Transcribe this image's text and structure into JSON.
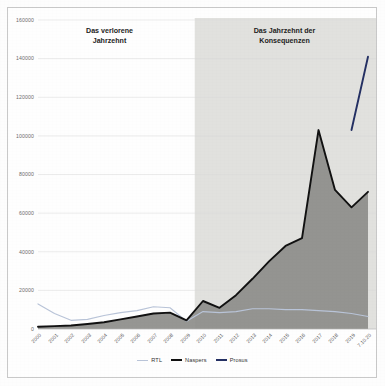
{
  "chart_data": {
    "type": "line",
    "title": "",
    "xlabel": "",
    "ylabel": "",
    "ylim": [
      0,
      160000
    ],
    "ytick_step": 20000,
    "ytick_labels": [
      "0",
      "20000",
      "40000",
      "60000",
      "80000",
      "100000",
      "120000",
      "140000",
      "160000"
    ],
    "ytick_values": [
      0,
      20000,
      40000,
      60000,
      80000,
      100000,
      120000,
      140000,
      160000
    ],
    "grid": true,
    "legend_position": "bottom",
    "categories": [
      "2000",
      "2001",
      "2002",
      "2003",
      "2004",
      "2005",
      "2006",
      "2007",
      "2008",
      "2009",
      "2010",
      "2011",
      "2012",
      "2013",
      "2014",
      "2015",
      "2016",
      "2017",
      "2018",
      "2019",
      "7.10.20"
    ],
    "series": [
      {
        "name": "RTL",
        "color": "#b9c4d8",
        "values": [
          13000,
          8000,
          4500,
          5000,
          7000,
          8500,
          9500,
          11500,
          11000,
          4000,
          9000,
          8500,
          9000,
          10500,
          10500,
          10000,
          10000,
          9500,
          9000,
          8000,
          6500
        ]
      },
      {
        "name": "Naspers",
        "color": "#111111",
        "values": [
          1200,
          1500,
          1800,
          2600,
          3500,
          5000,
          6500,
          8000,
          8500,
          4500,
          14500,
          11000,
          17500,
          26000,
          35000,
          43000,
          47000,
          103000,
          72000,
          63000,
          71000
        ]
      },
      {
        "name": "Prosus",
        "color": "#243063",
        "values": [
          null,
          null,
          null,
          null,
          null,
          null,
          null,
          null,
          null,
          null,
          null,
          null,
          null,
          null,
          null,
          null,
          null,
          null,
          null,
          103000,
          141000
        ]
      }
    ],
    "annotations": [
      {
        "name": "band-label-left",
        "text": "Das verlorene\nJahrzehnt"
      },
      {
        "name": "band-label-right",
        "text": "Das Jahrzehnt der\nKonsequenzen"
      }
    ],
    "shaded_band": {
      "name": "konsequenzen-band",
      "from_category": "2010",
      "to_category": "7.10.20",
      "color": "#dcdcd8"
    },
    "area_fill": {
      "series": "Naspers",
      "color": "#8d8d8a"
    }
  },
  "legend": {
    "items": [
      {
        "label": "RTL",
        "color": "#b9c4d8"
      },
      {
        "label": "Naspers",
        "color": "#111111"
      },
      {
        "label": "Prosus",
        "color": "#243063"
      }
    ]
  }
}
